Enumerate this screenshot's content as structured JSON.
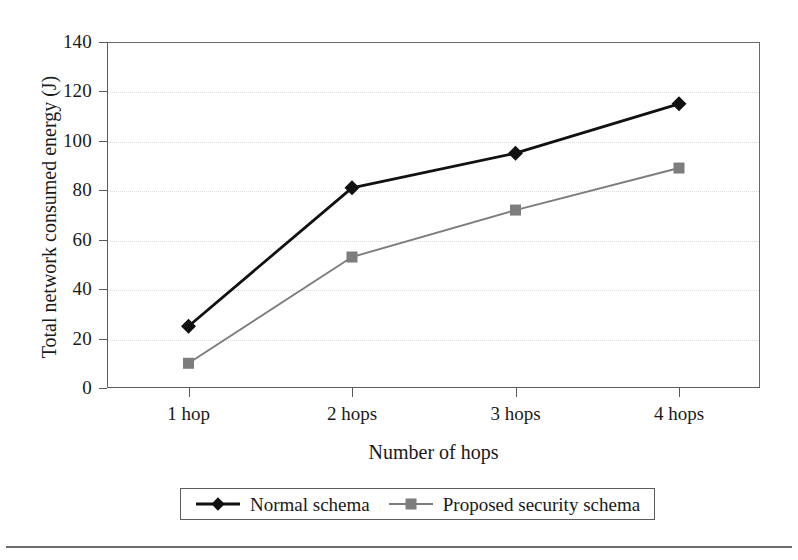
{
  "chart_data": {
    "type": "line",
    "title": "",
    "xlabel": "Number of hops",
    "ylabel": "Total network consumed energy (J)",
    "categories": [
      "1 hop",
      "2 hops",
      "3 hops",
      "4 hops"
    ],
    "ytick_labels": [
      "0",
      "20",
      "40",
      "60",
      "80",
      "100",
      "120",
      "140"
    ],
    "ytick_values": [
      0,
      20,
      40,
      60,
      80,
      100,
      120,
      140
    ],
    "ylim": [
      0,
      140
    ],
    "grid": true,
    "legend_position": "bottom-center",
    "series": [
      {
        "name": "Normal schema",
        "marker": "diamond",
        "color": "#111111",
        "values": [
          25,
          81,
          95,
          115
        ]
      },
      {
        "name": "Proposed security schema",
        "marker": "square",
        "color": "#7d7d7d",
        "values": [
          10,
          53,
          72,
          89
        ]
      }
    ]
  },
  "legend": {
    "entries": [
      {
        "label": "Normal schema"
      },
      {
        "label": "Proposed security schema"
      }
    ]
  },
  "colors": {
    "series_normal": "#111111",
    "series_proposed": "#7d7d7d",
    "axis": "#5b5b5b",
    "grid": "#dcdcdc",
    "rule": "#6d6d6d"
  }
}
